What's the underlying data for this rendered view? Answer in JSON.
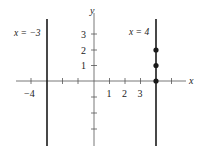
{
  "diagram": {
    "axes": {
      "x_label": "x",
      "y_label": "y",
      "x_tick_labels": [
        {
          "value": -4,
          "text": "−4"
        },
        {
          "value": 1,
          "text": "1"
        },
        {
          "value": 2,
          "text": "2"
        },
        {
          "value": 3,
          "text": "3"
        }
      ],
      "y_tick_labels": [
        {
          "value": 1,
          "text": "1"
        },
        {
          "value": 2,
          "text": "2"
        },
        {
          "value": 3,
          "text": "3"
        }
      ],
      "x_ticks": [
        -4,
        -3,
        -2,
        -1,
        1,
        2,
        3,
        4,
        5
      ],
      "y_ticks": [
        -3,
        -2,
        -1,
        1,
        2,
        3
      ]
    },
    "vertical_lines": [
      {
        "x": -3,
        "label": "x = −3"
      },
      {
        "x": 4,
        "label": "x = 4"
      }
    ],
    "points": [
      {
        "x": 4,
        "y": 0
      },
      {
        "x": 4,
        "y": 1
      },
      {
        "x": 4,
        "y": 2
      }
    ],
    "color": "#1a1a1a"
  }
}
